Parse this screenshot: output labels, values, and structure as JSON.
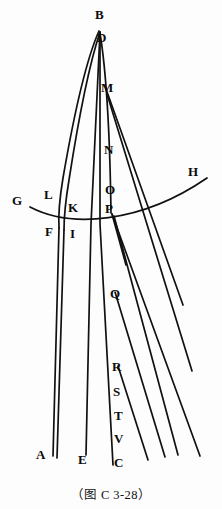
{
  "figure": {
    "caption": "（图 C 3-28）",
    "ink_color": "#111111",
    "background_color": "#fdfdfd",
    "labels": [
      {
        "text": "B",
        "x": 95,
        "y": 8,
        "name": "vertex-label-b"
      },
      {
        "text": "D",
        "x": 97,
        "y": 31,
        "name": "vertex-label-d"
      },
      {
        "text": "M",
        "x": 101,
        "y": 81,
        "name": "vertex-label-m"
      },
      {
        "text": "N",
        "x": 104,
        "y": 143,
        "name": "vertex-label-n"
      },
      {
        "text": "O",
        "x": 105,
        "y": 183,
        "name": "vertex-label-o"
      },
      {
        "text": "P",
        "x": 105,
        "y": 202,
        "name": "vertex-label-p"
      },
      {
        "text": "Q",
        "x": 110,
        "y": 287,
        "name": "vertex-label-q"
      },
      {
        "text": "R",
        "x": 112,
        "y": 360,
        "name": "vertex-label-r"
      },
      {
        "text": "S",
        "x": 113,
        "y": 385,
        "name": "vertex-label-s"
      },
      {
        "text": "T",
        "x": 114,
        "y": 409,
        "name": "vertex-label-t"
      },
      {
        "text": "V",
        "x": 114,
        "y": 432,
        "name": "vertex-label-v"
      },
      {
        "text": "C",
        "x": 114,
        "y": 456,
        "name": "vertex-label-c"
      },
      {
        "text": "E",
        "x": 78,
        "y": 453,
        "name": "vertex-label-e"
      },
      {
        "text": "A",
        "x": 36,
        "y": 448,
        "name": "vertex-label-a"
      },
      {
        "text": "G",
        "x": 12,
        "y": 194,
        "name": "vertex-label-g"
      },
      {
        "text": "H",
        "x": 188,
        "y": 165,
        "name": "vertex-label-h"
      },
      {
        "text": "L",
        "x": 44,
        "y": 188,
        "name": "vertex-label-l"
      },
      {
        "text": "K",
        "x": 68,
        "y": 201,
        "name": "vertex-label-k"
      },
      {
        "text": "F",
        "x": 45,
        "y": 225,
        "name": "vertex-label-f"
      },
      {
        "text": "I",
        "x": 70,
        "y": 227,
        "name": "vertex-label-i"
      }
    ],
    "strokes": [
      {
        "name": "axis-line-bd-to-c",
        "d": "M 100 32 L 100 224 L 113 465"
      },
      {
        "name": "axis-line-b-to-e",
        "d": "M 100 32 L 91 224 L 86 455"
      },
      {
        "name": "outer-left-curve-b-to-f",
        "d": "M 99 31 C 86 60 73 120 63 178 C 60 196 58 212 59 228"
      },
      {
        "name": "inner-left-curve-b-to-i",
        "d": "M 100 32 C 90 62 78 122 69 180 C 66 198 64 214 64 230"
      },
      {
        "name": "long-line-f-to-a",
        "d": "M 59 228 L 53 456"
      },
      {
        "name": "long-line-i-to-a2",
        "d": "M 64 230 L 57 458"
      },
      {
        "name": "horizon-curve-g-to-h",
        "d": "M 30 207 C 70 228 140 224 207 178"
      },
      {
        "name": "right-curve-d-to-p",
        "d": "M 100 33 C 106 70 110 140 111 213"
      },
      {
        "name": "ray-m-to-right-1",
        "d": "M 106 89 L 183 305"
      },
      {
        "name": "ray-m-to-right-2",
        "d": "M 107 94 L 192 371"
      },
      {
        "name": "ray-p-to-right-3",
        "d": "M 112 214 L 200 456"
      },
      {
        "name": "ray-p-to-right-4",
        "d": "M 114 216 L 178 455"
      },
      {
        "name": "ray-q-to-right-5",
        "d": "M 115 292 L 165 457"
      },
      {
        "name": "ray-r-to-right-6",
        "d": "M 118 366 L 148 460"
      },
      {
        "name": "short-line-q-spur",
        "d": "M 112 214 L 126 265"
      }
    ]
  }
}
